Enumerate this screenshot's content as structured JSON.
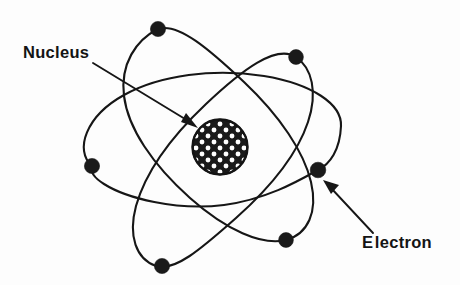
{
  "figure": {
    "kind": "atom-diagram",
    "background_color": "#fdfdfd",
    "ink_color": "#161616"
  },
  "labels": {
    "nucleus": {
      "text": "Nucleus",
      "lead_char": "N",
      "rest": "ucleus",
      "x": 23,
      "y": 44
    },
    "electron": {
      "text": "Electron",
      "lead_char": "E",
      "rest": "lectron",
      "x": 362,
      "y": 234
    }
  },
  "nucleus": {
    "name": "nucleus",
    "center_x": 220,
    "center_y": 147,
    "radius": 28,
    "fill_color": "#1a1a1a",
    "nucleon_color": "#ffffff",
    "nucleon_count": 37,
    "texture": "white-dot-grid"
  },
  "orbits": [
    {
      "name": "orbit-horizontal",
      "cx": 205,
      "cy": 151,
      "rx": 116,
      "ry": 58,
      "rotation_deg": -7
    },
    {
      "name": "orbit-steep-left",
      "cx": 205,
      "cy": 148,
      "rx": 118,
      "ry": 56,
      "rotation_deg": 60
    },
    {
      "name": "orbit-steep-right",
      "cx": 207,
      "cy": 149,
      "rx": 119,
      "ry": 56,
      "rotation_deg": -60
    }
  ],
  "electrons": [
    {
      "name": "electron-top",
      "x": 158,
      "y": 29,
      "r": 7.5
    },
    {
      "name": "electron-upper-right",
      "x": 296,
      "y": 57,
      "r": 7.5
    },
    {
      "name": "electron-left",
      "x": 92,
      "y": 166,
      "r": 7.5
    },
    {
      "name": "electron-right",
      "x": 318,
      "y": 170,
      "r": 7.5
    },
    {
      "name": "electron-bottom-right",
      "x": 286,
      "y": 240,
      "r": 7.5
    },
    {
      "name": "electron-bottom-left",
      "x": 162,
      "y": 266,
      "r": 7.5
    }
  ],
  "leaders": [
    {
      "name": "nucleus-leader",
      "from_x": 93,
      "from_y": 63,
      "to_x": 197,
      "to_y": 127,
      "points_to": "nucleus"
    },
    {
      "name": "electron-leader",
      "from_x": 373,
      "from_y": 233,
      "to_x": 324,
      "to_y": 181,
      "points_to": "electron-right"
    }
  ]
}
